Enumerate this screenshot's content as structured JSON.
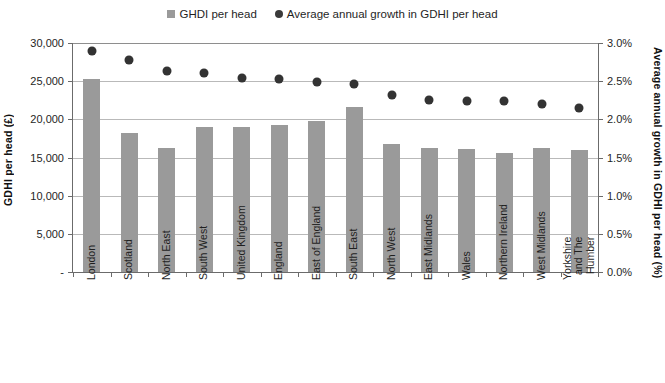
{
  "legend": {
    "items": [
      {
        "label": "GHDI per head",
        "marker": "square-marker-icon",
        "color": "#9a9a9a"
      },
      {
        "label": "Average annual  growth in GDHI per head",
        "marker": "circle-marker-icon",
        "color": "#333333"
      }
    ]
  },
  "axes": {
    "y_left_title": "GDHI per head (£)",
    "y_right_title": "Average annual  growth in GDHI per head (%)",
    "y_left_ticks": [
      "30,000",
      "25,000",
      "20,000",
      "15,000",
      "10,000",
      "5,000",
      "-"
    ],
    "y_right_ticks": [
      "3.0%",
      "2.5%",
      "2.0%",
      "1.5%",
      "1.0%",
      "0.5%",
      "0.0%"
    ]
  },
  "chart_data": {
    "type": "bar",
    "title": "",
    "xlabel": "",
    "ylabel": "GDHI per head (£)",
    "y2label": "Average annual  growth in GDHI per head (%)",
    "ylim": [
      0,
      30000
    ],
    "y2lim": [
      0,
      3.0
    ],
    "grid": true,
    "legend_position": "top-center",
    "categories": [
      "London",
      "Scotland",
      "North East",
      "South West",
      "United Kingdom",
      "England",
      "East of England",
      "South East",
      "North West",
      "East Midlands",
      "Wales",
      "Northern Ireland",
      "West Midlands",
      "Yorkshire and The Humber"
    ],
    "series": [
      {
        "name": "GHDI per head",
        "type": "bar",
        "axis": "left",
        "color": "#9a9a9a",
        "values": [
          25300,
          18200,
          16200,
          19000,
          19000,
          19300,
          19800,
          21600,
          16800,
          16300,
          16100,
          15600,
          16300,
          16000
        ]
      },
      {
        "name": "Average annual  growth in GDHI per head",
        "type": "scatter",
        "axis": "right",
        "color": "#333333",
        "values": [
          2.9,
          2.78,
          2.63,
          2.61,
          2.54,
          2.53,
          2.49,
          2.46,
          2.32,
          2.25,
          2.24,
          2.24,
          2.2,
          2.15
        ]
      }
    ]
  }
}
